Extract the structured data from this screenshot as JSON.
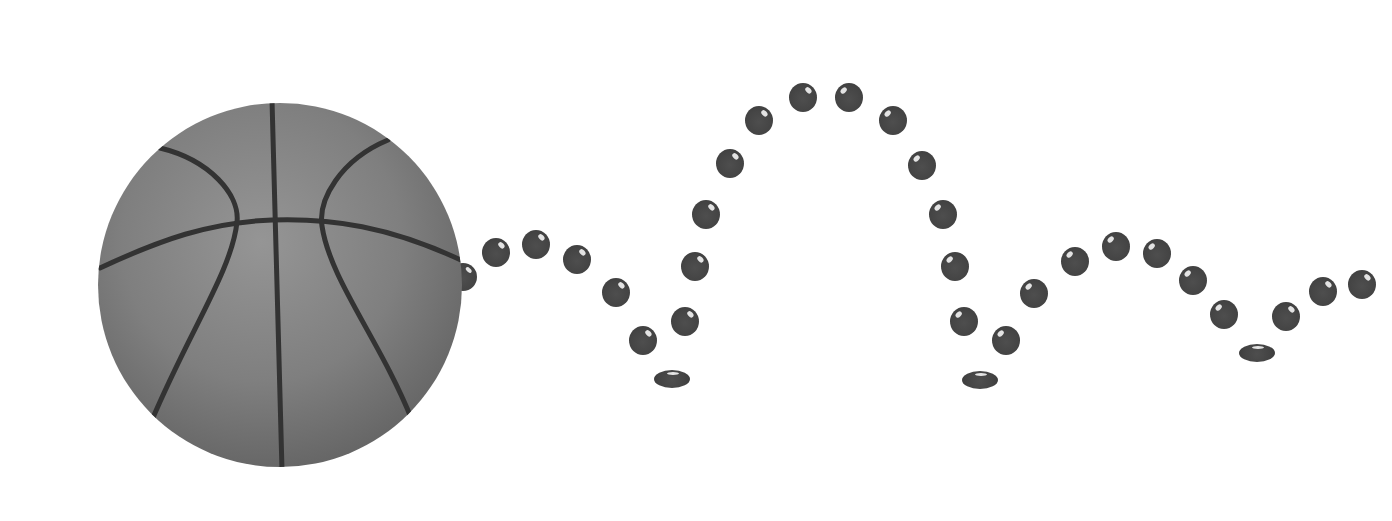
{
  "scene": {
    "description": "Basketball with a bouncing-ball trajectory of dark dots",
    "background_color": "#ffffff",
    "ball": {
      "cx": 280,
      "cy": 285,
      "r": 182,
      "color": "#7d7d7d",
      "seam_color": "#333333"
    },
    "trajectory": {
      "dot_color": "#464646",
      "dots": [
        {
          "x": 463,
          "y": 277,
          "w": 28,
          "h": 28,
          "hl": "right"
        },
        {
          "x": 496,
          "y": 252,
          "w": 28,
          "h": 29,
          "hl": "right"
        },
        {
          "x": 536,
          "y": 244,
          "w": 28,
          "h": 29,
          "hl": "right"
        },
        {
          "x": 577,
          "y": 259,
          "w": 28,
          "h": 29,
          "hl": "right"
        },
        {
          "x": 616,
          "y": 292,
          "w": 28,
          "h": 29,
          "hl": "right"
        },
        {
          "x": 643,
          "y": 340,
          "w": 28,
          "h": 29,
          "hl": "right"
        },
        {
          "x": 672,
          "y": 379,
          "w": 36,
          "h": 18,
          "hl": "flat"
        },
        {
          "x": 685,
          "y": 321,
          "w": 28,
          "h": 29,
          "hl": "right"
        },
        {
          "x": 695,
          "y": 266,
          "w": 28,
          "h": 29,
          "hl": "right"
        },
        {
          "x": 706,
          "y": 214,
          "w": 28,
          "h": 29,
          "hl": "right"
        },
        {
          "x": 730,
          "y": 163,
          "w": 28,
          "h": 29,
          "hl": "right"
        },
        {
          "x": 759,
          "y": 120,
          "w": 28,
          "h": 29,
          "hl": "right"
        },
        {
          "x": 803,
          "y": 97,
          "w": 28,
          "h": 29,
          "hl": "right"
        },
        {
          "x": 849,
          "y": 97,
          "w": 28,
          "h": 29,
          "hl": "left"
        },
        {
          "x": 893,
          "y": 120,
          "w": 28,
          "h": 29,
          "hl": "left"
        },
        {
          "x": 922,
          "y": 165,
          "w": 28,
          "h": 29,
          "hl": "left"
        },
        {
          "x": 943,
          "y": 214,
          "w": 28,
          "h": 29,
          "hl": "left"
        },
        {
          "x": 955,
          "y": 266,
          "w": 28,
          "h": 29,
          "hl": "left"
        },
        {
          "x": 964,
          "y": 321,
          "w": 28,
          "h": 29,
          "hl": "left"
        },
        {
          "x": 980,
          "y": 380,
          "w": 36,
          "h": 18,
          "hl": "flat"
        },
        {
          "x": 1006,
          "y": 340,
          "w": 28,
          "h": 29,
          "hl": "left"
        },
        {
          "x": 1034,
          "y": 293,
          "w": 28,
          "h": 29,
          "hl": "left"
        },
        {
          "x": 1075,
          "y": 261,
          "w": 28,
          "h": 29,
          "hl": "left"
        },
        {
          "x": 1116,
          "y": 246,
          "w": 28,
          "h": 29,
          "hl": "left"
        },
        {
          "x": 1157,
          "y": 253,
          "w": 28,
          "h": 29,
          "hl": "left"
        },
        {
          "x": 1193,
          "y": 280,
          "w": 28,
          "h": 29,
          "hl": "left"
        },
        {
          "x": 1224,
          "y": 314,
          "w": 28,
          "h": 29,
          "hl": "left"
        },
        {
          "x": 1257,
          "y": 353,
          "w": 36,
          "h": 18,
          "hl": "flat"
        },
        {
          "x": 1286,
          "y": 316,
          "w": 28,
          "h": 29,
          "hl": "right"
        },
        {
          "x": 1323,
          "y": 291,
          "w": 28,
          "h": 29,
          "hl": "right"
        },
        {
          "x": 1362,
          "y": 284,
          "w": 28,
          "h": 29,
          "hl": "right"
        }
      ]
    }
  }
}
